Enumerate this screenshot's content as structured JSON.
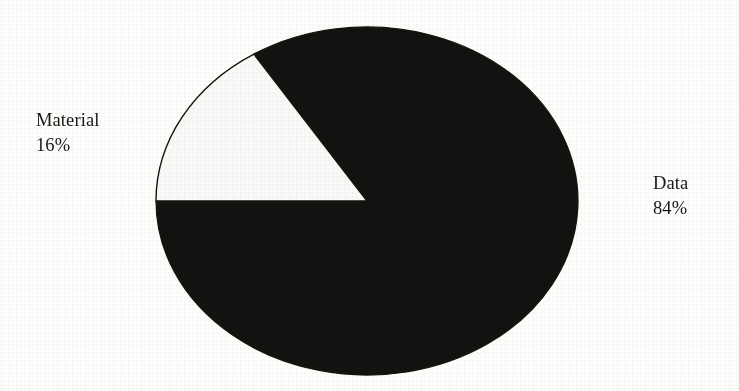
{
  "figure": {
    "background_color": "#fdfdfb",
    "slice_dark_color": "#121210",
    "slice_light_color": "#f9f9f7",
    "outline_color": "#15150f",
    "text_color": "#171715"
  },
  "labels": {
    "material": {
      "name": "Material",
      "percent": "16%"
    },
    "data": {
      "name": "Data",
      "percent": "84%"
    }
  },
  "chart_data": {
    "type": "pie",
    "title": "",
    "categories": [
      "Data",
      "Material"
    ],
    "values": [
      84,
      16
    ],
    "value_unit": "percent",
    "data_labels": [
      "Data\n84%",
      "Material\n16%"
    ],
    "slice_colors": [
      "#121210",
      "#f9f9f7"
    ],
    "legend": "none",
    "label_position": "outside",
    "start_angle_deg": 180,
    "direction": "counterclockwise",
    "shape": "ellipse",
    "center_px": [
      367,
      201
    ],
    "radius_x_px": 211,
    "radius_y_px": 174,
    "grid": false,
    "xlabel": "",
    "ylabel": ""
  }
}
